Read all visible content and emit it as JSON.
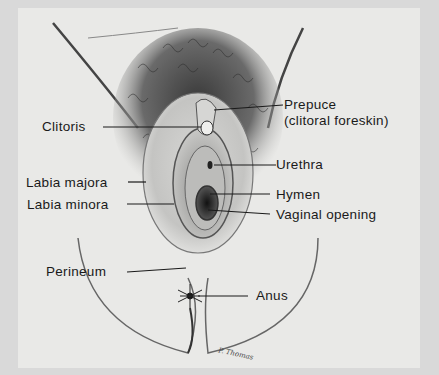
{
  "figure": {
    "signature": "P. Thomas",
    "colors": {
      "background": "#e9e9e7",
      "ink": "#1a1a1a"
    }
  },
  "labels": [
    {
      "id": "prepuce",
      "text": "Prepuce"
    },
    {
      "id": "prepuce_sub",
      "text": "(clitoral foreskin)"
    },
    {
      "id": "clitoris",
      "text": "Clitoris"
    },
    {
      "id": "urethra",
      "text": "Urethra"
    },
    {
      "id": "labia_majora",
      "text": "Labia majora"
    },
    {
      "id": "hymen",
      "text": "Hymen"
    },
    {
      "id": "labia_minora",
      "text": "Labia minora"
    },
    {
      "id": "vaginal_opening",
      "text": "Vaginal opening"
    },
    {
      "id": "perineum",
      "text": "Perineum"
    },
    {
      "id": "anus",
      "text": "Anus"
    }
  ]
}
